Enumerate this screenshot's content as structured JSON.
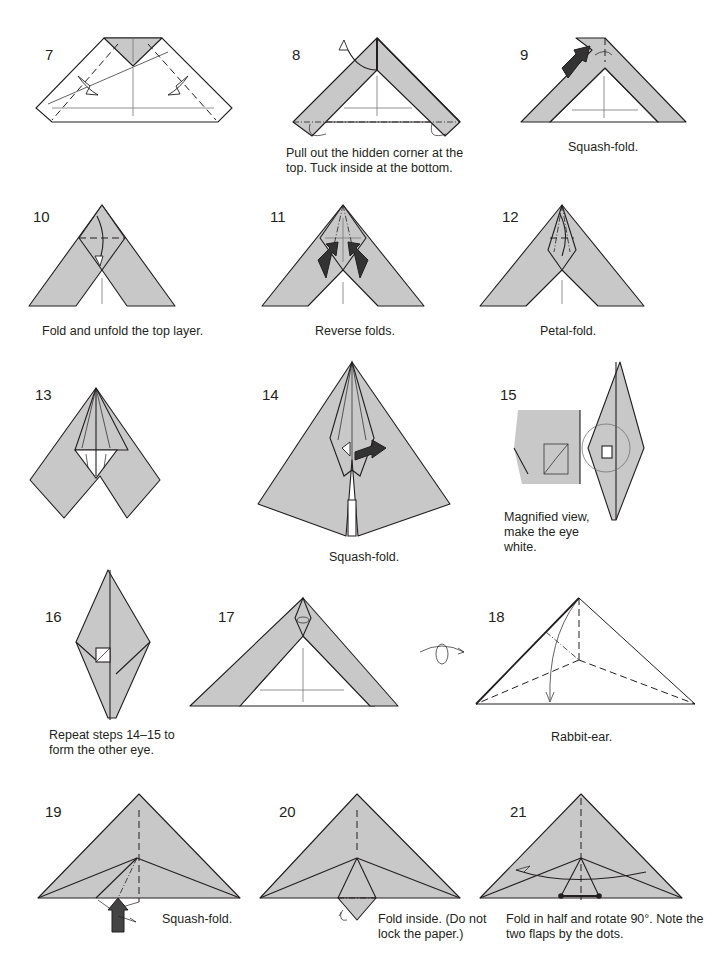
{
  "page": {
    "paper_color": "#c8c8c8",
    "line_color": "#231f20",
    "background": "#ffffff"
  },
  "steps": [
    {
      "number": "7",
      "caption": ""
    },
    {
      "number": "8",
      "caption": "Pull out the hidden corner at the top. Tuck inside at the bottom."
    },
    {
      "number": "9",
      "caption": "Squash-fold."
    },
    {
      "number": "10",
      "caption": "Fold and unfold the top layer."
    },
    {
      "number": "11",
      "caption": "Reverse folds."
    },
    {
      "number": "12",
      "caption": "Petal-fold."
    },
    {
      "number": "13",
      "caption": ""
    },
    {
      "number": "14",
      "caption": "Squash-fold."
    },
    {
      "number": "15",
      "caption": "Magnified view, make the eye white."
    },
    {
      "number": "16",
      "caption": "Repeat steps 14–15 to form the other eye."
    },
    {
      "number": "17",
      "caption": ""
    },
    {
      "number": "18",
      "caption": "Rabbit-ear."
    },
    {
      "number": "19",
      "caption": "Squash-fold."
    },
    {
      "number": "20",
      "caption": "Fold inside. (Do not lock the paper.)"
    },
    {
      "number": "21",
      "caption": "Fold in half and rotate 90°. Note the two flaps by the dots."
    }
  ],
  "icons": {
    "turn_over": "turn-over-icon",
    "push_arrow": "push-arrow-icon",
    "fold_arrow": "fold-arrow-icon"
  }
}
